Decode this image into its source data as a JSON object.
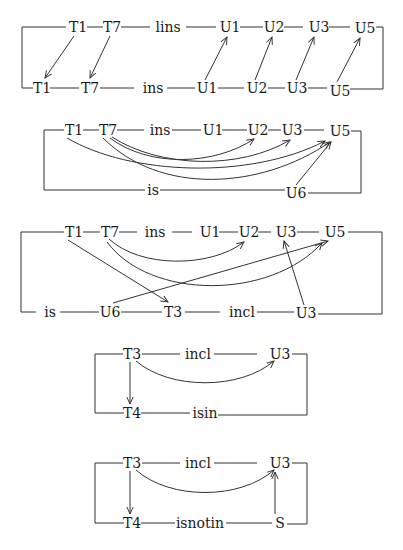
{
  "diagrams": [
    {
      "id": "d1",
      "top_row": [
        {
          "label": "T1",
          "x": 78
        },
        {
          "label": "T7",
          "x": 112
        },
        {
          "label": "lins",
          "x": 168
        },
        {
          "label": "U1",
          "x": 230
        },
        {
          "label": "U2",
          "x": 274
        },
        {
          "label": "U3",
          "x": 319
        },
        {
          "label": "U5",
          "x": 365
        }
      ],
      "bottom_row": [
        {
          "label": "T1",
          "x": 42
        },
        {
          "label": "T7",
          "x": 90
        },
        {
          "label": "ins",
          "x": 153
        },
        {
          "label": "U1",
          "x": 207
        },
        {
          "label": "U2",
          "x": 257
        },
        {
          "label": "U3",
          "x": 297
        },
        {
          "label": "U5",
          "x": 340
        }
      ],
      "arrows": [
        "T1(top)→T1(bottom)",
        "T7(top)→T7(bottom)",
        "U1(bottom)→U1(top)",
        "U2(bottom)→U2(top)",
        "U3(bottom)→U3(top)",
        "U5(bottom)→U5(top)"
      ]
    },
    {
      "id": "d2",
      "top_row": [
        {
          "label": "T1",
          "x": 74
        },
        {
          "label": "T7",
          "x": 108
        },
        {
          "label": "ins",
          "x": 160
        },
        {
          "label": "U1",
          "x": 213
        },
        {
          "label": "U2",
          "x": 258
        },
        {
          "label": "U3",
          "x": 292
        },
        {
          "label": "U5",
          "x": 340
        }
      ],
      "bottom_row": [
        {
          "label": "is",
          "x": 153
        },
        {
          "label": "U6",
          "x": 296
        }
      ],
      "arrows": [
        "T7→U2 (curved)",
        "T1→U5 (curved)",
        "T7→U3 (curved)",
        "T7→U5 (curved)",
        "U6→U5"
      ]
    },
    {
      "id": "d3",
      "top_row": [
        {
          "label": "T1",
          "x": 74
        },
        {
          "label": "T7",
          "x": 110
        },
        {
          "label": "ins",
          "x": 155
        },
        {
          "label": "U1",
          "x": 210
        },
        {
          "label": "U2",
          "x": 249
        },
        {
          "label": "U3",
          "x": 286
        },
        {
          "label": "U5",
          "x": 335
        }
      ],
      "bottom_row": [
        {
          "label": "is",
          "x": 50
        },
        {
          "label": "U6",
          "x": 110
        },
        {
          "label": "T3",
          "x": 173
        },
        {
          "label": "incl",
          "x": 242
        },
        {
          "label": "U3",
          "x": 306
        }
      ],
      "arrows": [
        "T7→U2 (curved)",
        "T7→U5 (curved)",
        "T1→T3",
        "U6→U5",
        "U3(bottom)→U3(top)"
      ]
    },
    {
      "id": "d4",
      "top_row": [
        {
          "label": "T3",
          "x": 132
        },
        {
          "label": "incl",
          "x": 198
        },
        {
          "label": "U3",
          "x": 280
        }
      ],
      "bottom_row": [
        {
          "label": "T4",
          "x": 132
        },
        {
          "label": "isin",
          "x": 205
        }
      ],
      "arrows": [
        "T3→U3 (curved)",
        "T3→T4"
      ]
    },
    {
      "id": "d5",
      "top_row": [
        {
          "label": "T3",
          "x": 132
        },
        {
          "label": "incl",
          "x": 198
        },
        {
          "label": "U3",
          "x": 280
        }
      ],
      "bottom_row": [
        {
          "label": "T4",
          "x": 132
        },
        {
          "label": "isnotin",
          "x": 200
        },
        {
          "label": "S",
          "x": 280
        }
      ],
      "arrows": [
        "T3→U3 (curved)",
        "T3→T4",
        "S→U3"
      ]
    }
  ]
}
